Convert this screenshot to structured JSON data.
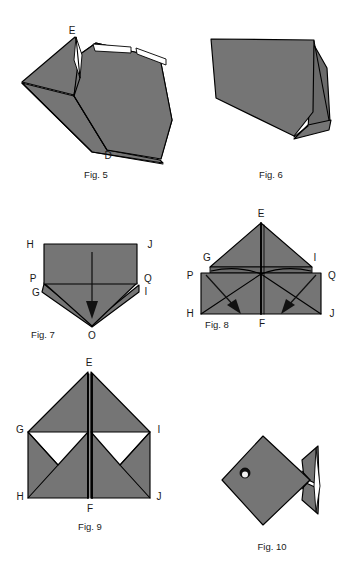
{
  "page": {
    "background_color": "#ffffff",
    "width": 352,
    "height": 570
  },
  "style": {
    "paper_fill": "#757575",
    "paper_fill_shadow": "#6b6b6b",
    "paper_fill_light": "#7d7d7d",
    "outline_color": "#000000",
    "label_color": "#1a1a1a",
    "white_color": "#ffffff"
  },
  "figures": [
    {
      "id": "fig5",
      "caption": "Fig. 5",
      "vertex_labels": [
        {
          "text": "E",
          "x": 72,
          "y": 34
        },
        {
          "text": "D",
          "x": 108,
          "y": 157
        }
      ]
    },
    {
      "id": "fig6",
      "caption": "Fig. 6",
      "vertex_labels": []
    },
    {
      "id": "fig7",
      "caption": "Fig.  7",
      "vertex_labels": [
        {
          "text": "H",
          "x": 28,
          "y": 244
        },
        {
          "text": "J",
          "x": 147,
          "y": 244
        },
        {
          "text": "P",
          "x": 31,
          "y": 278
        },
        {
          "text": "Q",
          "x": 145,
          "y": 278
        },
        {
          "text": "G",
          "x": 35,
          "y": 296
        },
        {
          "text": "I",
          "x": 143,
          "y": 294
        },
        {
          "text": "O",
          "x": 92,
          "y": 328
        }
      ]
    },
    {
      "id": "fig8",
      "caption": "Fig.  8",
      "vertex_labels": [
        {
          "text": "E",
          "x": 258,
          "y": 214
        },
        {
          "text": "G",
          "x": 203,
          "y": 258
        },
        {
          "text": "I",
          "x": 311,
          "y": 258
        },
        {
          "text": "P",
          "x": 186,
          "y": 275
        },
        {
          "text": "Q",
          "x": 330,
          "y": 275
        },
        {
          "text": "H",
          "x": 186,
          "y": 313
        },
        {
          "text": "J",
          "x": 330,
          "y": 313
        },
        {
          "text": "F",
          "x": 261,
          "y": 325
        }
      ]
    },
    {
      "id": "fig9",
      "caption": "Fig. 9",
      "vertex_labels": [
        {
          "text": "E",
          "x": 89,
          "y": 363
        },
        {
          "text": "G",
          "x": 22,
          "y": 429
        },
        {
          "text": "I",
          "x": 158,
          "y": 429
        },
        {
          "text": "H",
          "x": 22,
          "y": 496
        },
        {
          "text": "J",
          "x": 158,
          "y": 496
        },
        {
          "text": "F",
          "x": 89,
          "y": 512
        }
      ]
    },
    {
      "id": "fig10",
      "caption": "Fig. 10",
      "vertex_labels": []
    }
  ],
  "captions": {
    "fig5": "Fig. 5",
    "fig6": "Fig. 6",
    "fig7": "Fig.  7",
    "fig8": "Fig.  8",
    "fig9": "Fig. 9",
    "fig10": "Fig. 10"
  },
  "annotations": {
    "fig7_fold_arrow": "downward-fold-arrow",
    "fig8_left_arrow": "inside-reverse-fold-arrow-left",
    "fig8_right_arrow": "inside-reverse-fold-arrow-right",
    "fig10_eye": "fish-eye"
  }
}
